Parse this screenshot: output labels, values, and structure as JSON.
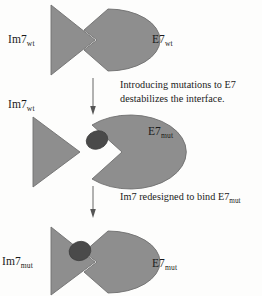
{
  "figure": {
    "title_alt": "Protein interface redesign schematic",
    "background_color": "#fdfdfc",
    "shape_fill": "#8e8e8e",
    "shape_stroke": "#6f6f6f",
    "mutation_patch_color": "#4a4a4a",
    "arrow_color": "#555555",
    "text_color": "#1a1a1a"
  },
  "panels": [
    {
      "id": "panel-wt-complex",
      "state": "bound",
      "left_label": {
        "text": "Im7",
        "sub": "wt"
      },
      "right_label": {
        "text": "E7",
        "sub": "wt"
      },
      "left_shape": "triangle",
      "right_shape": "ellipse-notched",
      "has_mutation_patch": false
    },
    {
      "id": "panel-mut-destabilized",
      "state": "unbound",
      "left_label": {
        "text": "Im7",
        "sub": "wt"
      },
      "right_label": {
        "text": "E7",
        "sub": "mut"
      },
      "left_shape": "triangle",
      "right_shape": "pacman-wide-notch",
      "has_mutation_patch": true
    },
    {
      "id": "panel-redesigned-complex",
      "state": "bound",
      "left_label": {
        "text": "Im7",
        "sub": "mut"
      },
      "right_label": {
        "text": "E7",
        "sub": "mut"
      },
      "left_shape": "triangle",
      "right_shape": "ellipse-notched",
      "has_mutation_patch": true
    }
  ],
  "arrows": [
    {
      "id": "arrow-1",
      "direction": "down",
      "caption_line_1": "Introducing mutations to E7",
      "caption_line_2": "destabilizes the interface."
    },
    {
      "id": "arrow-2",
      "direction": "down",
      "caption_line_1": "Im7 redesigned to bind E7",
      "caption_sub_1": "mut",
      "caption_line_2": ""
    }
  ]
}
